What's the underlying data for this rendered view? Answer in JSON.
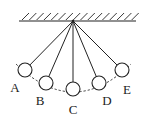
{
  "diagram": {
    "colors": {
      "stroke": "#222222",
      "background": "#ffffff"
    },
    "ceiling": {
      "x1": 19,
      "x2": 136,
      "y": 21,
      "hatch_count": 16
    },
    "pivot": {
      "x": 73,
      "y": 21
    },
    "bob_radius": 7,
    "positions": [
      {
        "label": "A",
        "cx": 25,
        "cy": 70,
        "lx": 15,
        "ly": 92
      },
      {
        "label": "B",
        "cx": 46,
        "cy": 83,
        "lx": 40,
        "ly": 105
      },
      {
        "label": "C",
        "cx": 73,
        "cy": 89,
        "lx": 73,
        "ly": 114
      },
      {
        "label": "D",
        "cx": 99,
        "cy": 83,
        "lx": 107,
        "ly": 105
      },
      {
        "label": "E",
        "cx": 122,
        "cy": 70,
        "lx": 127,
        "ly": 94
      }
    ],
    "arc": {
      "style": "dashed",
      "description": "trajectory arc of bob"
    }
  }
}
